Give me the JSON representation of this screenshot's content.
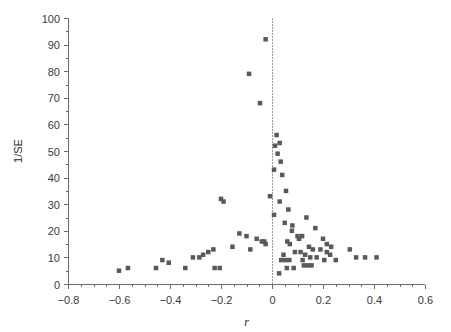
{
  "chart_data": {
    "type": "scatter",
    "title": "",
    "subtitle": "",
    "xlabel": "r",
    "ylabel": "1/SE",
    "xlim": [
      -0.8,
      0.6
    ],
    "ylim": [
      0,
      100
    ],
    "xticks": [
      -0.8,
      -0.6,
      -0.4,
      -0.2,
      0,
      0.2,
      0.4,
      0.6
    ],
    "xticklabels": [
      "−0.8",
      "−0.6",
      "−0.4",
      "−0.2",
      "0",
      "0.2",
      "0.4",
      "0.6"
    ],
    "yticks": [
      0,
      10,
      20,
      30,
      40,
      50,
      60,
      70,
      80,
      90,
      100
    ],
    "yticklabels": [
      "0",
      "10",
      "20",
      "30",
      "40",
      "50",
      "60",
      "70",
      "80",
      "90",
      "100"
    ],
    "xminortick_step": 0.05,
    "yminortick_step": 5,
    "grid": false,
    "legend": null,
    "legend_position": "none",
    "annotations": [
      {
        "kind": "vline",
        "x": 0,
        "style": "dotted",
        "label": "null-effect reference line"
      }
    ],
    "marker": {
      "shape": "square",
      "size": 4.5,
      "color": "#595959"
    },
    "series": [
      {
        "name": "studies",
        "points": [
          [
            -0.025,
            92
          ],
          [
            -0.09,
            79
          ],
          [
            -0.047,
            68
          ],
          [
            0.018,
            56
          ],
          [
            0.03,
            53
          ],
          [
            0.012,
            52
          ],
          [
            0.022,
            49
          ],
          [
            0.034,
            46
          ],
          [
            0.008,
            43
          ],
          [
            0.04,
            41
          ],
          [
            0.055,
            35
          ],
          [
            -0.008,
            33
          ],
          [
            -0.2,
            32
          ],
          [
            -0.19,
            31
          ],
          [
            0.03,
            31
          ],
          [
            0.064,
            28
          ],
          [
            0.008,
            26
          ],
          [
            0.135,
            25
          ],
          [
            0.05,
            23
          ],
          [
            0.08,
            22
          ],
          [
            0.17,
            21
          ],
          [
            0.078,
            20
          ],
          [
            -0.128,
            19
          ],
          [
            -0.1,
            18
          ],
          [
            0.1,
            18
          ],
          [
            0.118,
            18
          ],
          [
            0.106,
            17
          ],
          [
            0.2,
            17
          ],
          [
            -0.06,
            17
          ],
          [
            -0.04,
            16
          ],
          [
            -0.03,
            16
          ],
          [
            -0.025,
            15
          ],
          [
            0.06,
            16
          ],
          [
            0.07,
            15
          ],
          [
            0.215,
            15
          ],
          [
            0.232,
            14
          ],
          [
            0.145,
            14
          ],
          [
            0.16,
            13
          ],
          [
            0.19,
            13
          ],
          [
            -0.155,
            14
          ],
          [
            -0.085,
            13
          ],
          [
            -0.23,
            13
          ],
          [
            -0.25,
            12
          ],
          [
            0.09,
            12
          ],
          [
            0.112,
            12
          ],
          [
            0.215,
            12
          ],
          [
            0.228,
            11
          ],
          [
            0.045,
            11
          ],
          [
            0.13,
            11
          ],
          [
            0.15,
            10
          ],
          [
            0.175,
            10
          ],
          [
            -0.27,
            11
          ],
          [
            -0.285,
            10
          ],
          [
            -0.31,
            10
          ],
          [
            0.036,
            9
          ],
          [
            0.052,
            9
          ],
          [
            0.068,
            9
          ],
          [
            0.12,
            9
          ],
          [
            0.205,
            9
          ],
          [
            0.25,
            9
          ],
          [
            0.305,
            13
          ],
          [
            0.33,
            10
          ],
          [
            0.365,
            10
          ],
          [
            0.41,
            10
          ],
          [
            0.125,
            7
          ],
          [
            0.14,
            7
          ],
          [
            0.155,
            7
          ],
          [
            0.058,
            6
          ],
          [
            0.085,
            6
          ],
          [
            0.028,
            4
          ],
          [
            -0.34,
            6
          ],
          [
            -0.225,
            6
          ],
          [
            -0.205,
            6
          ],
          [
            -0.455,
            6
          ],
          [
            -0.43,
            9
          ],
          [
            -0.405,
            8
          ],
          [
            -0.565,
            6
          ],
          [
            -0.6,
            5
          ]
        ]
      }
    ]
  }
}
